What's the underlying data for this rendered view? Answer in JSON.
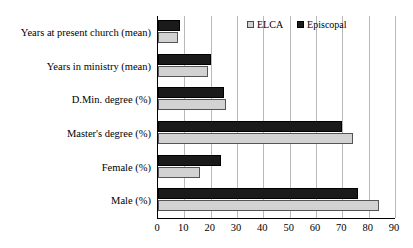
{
  "chart_data": {
    "type": "bar",
    "orientation": "horizontal",
    "title": "",
    "xlabel": "",
    "ylabel": "",
    "xlim": [
      0,
      90
    ],
    "xticks": [
      0,
      10,
      20,
      30,
      40,
      50,
      60,
      70,
      80,
      90
    ],
    "grid": true,
    "legend_position": "top-right",
    "categories": [
      "Years at present church (mean)",
      "Years in ministry (mean)",
      "D.Min. degree (%)",
      "Master's degree (%)",
      "Female (%)",
      "Male (%)"
    ],
    "series": [
      {
        "name": "ELCA",
        "color": "#d2d2d2",
        "values": [
          7.6,
          19,
          26,
          74,
          16,
          84
        ]
      },
      {
        "name": "Episcopal",
        "color": "#1a1a1a",
        "values": [
          8.4,
          20,
          25,
          70,
          24,
          76
        ]
      }
    ]
  },
  "legend": {
    "items": [
      {
        "label": "ELCA",
        "swatch": "elca-swatch"
      },
      {
        "label": "Episcopal",
        "swatch": "episcopal-swatch"
      }
    ]
  }
}
